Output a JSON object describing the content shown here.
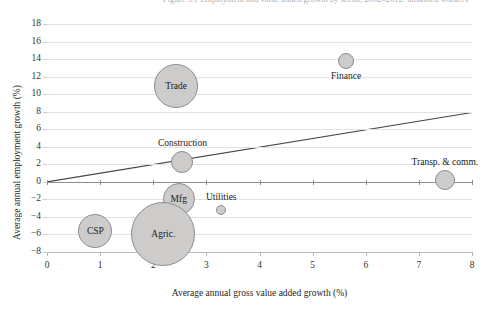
{
  "figure": {
    "title_fragment": "Figure 3.1  Employment and value added growth by sector, 2002–2012: unskilled workers",
    "background_color": "#ffffff",
    "bubble_fill": "#cdcccb",
    "bubble_stroke": "#8f8d8b",
    "grid_color": "#e4e2e0",
    "axis_color": "#b9b6b3"
  },
  "chart_data": {
    "type": "scatter",
    "title": "Figure 3.1  Employment and value added growth by sector, 2002–2012: unskilled workers",
    "xlabel": "Average annual gross value added growth (%)",
    "ylabel": "Average annual employment growth (%)",
    "xlim": [
      0,
      8
    ],
    "ylim": [
      -8,
      18
    ],
    "xticks": [
      0,
      1,
      2,
      3,
      4,
      5,
      6,
      7,
      8
    ],
    "yticks": [
      -8,
      -6,
      -4,
      -2,
      0,
      2,
      4,
      6,
      8,
      10,
      12,
      14,
      16,
      18
    ],
    "grid": true,
    "legend": "none",
    "size_encoding": "bubble area proportional to sector employment share",
    "points": [
      {
        "label": "Trade",
        "x": 2.43,
        "y": 10.9,
        "r_px": 22,
        "label_pos": "inside"
      },
      {
        "label": "Finance",
        "x": 5.63,
        "y": 13.8,
        "r_px": 8,
        "label_pos": "below"
      },
      {
        "label": "Construction",
        "x": 2.55,
        "y": 2.3,
        "r_px": 11,
        "label_pos": "above"
      },
      {
        "label": "Mfg",
        "x": 2.48,
        "y": -2.0,
        "r_px": 16,
        "label_pos": "inside"
      },
      {
        "label": "Agric.",
        "x": 2.19,
        "y": -6.0,
        "r_px": 32,
        "label_pos": "inside"
      },
      {
        "label": "Utilities",
        "x": 3.28,
        "y": -3.2,
        "r_px": 5,
        "label_pos": "above"
      },
      {
        "label": "CSP",
        "x": 0.91,
        "y": -5.6,
        "r_px": 17,
        "label_pos": "inside"
      },
      {
        "label": "Transp. & comm.",
        "x": 7.49,
        "y": 0.25,
        "r_px": 10,
        "label_pos": "above"
      }
    ],
    "trendline": {
      "x0": 0.0,
      "y0": 0.0,
      "x1": 8.0,
      "y1": 7.9
    }
  }
}
